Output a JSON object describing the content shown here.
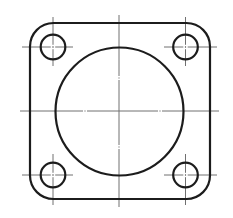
{
  "drawing": {
    "description": "Square flange plate with large central bore and four corner bolt holes (engineering top view)",
    "canvas": {
      "width": 233,
      "height": 218,
      "background": "#ffffff"
    },
    "colors": {
      "outline": "#1c1c1c",
      "centerline": "#707070"
    },
    "stroke_widths": {
      "outline": 2.2,
      "centerline": 1
    },
    "plate": {
      "x": 30,
      "y": 23,
      "width": 180,
      "height": 176,
      "corner_radius": 23.5
    },
    "bore": {
      "cx": 119.5,
      "cy": 111.5,
      "r": 64
    },
    "holes": [
      {
        "name": "hole-top-left",
        "cx": 53,
        "cy": 47,
        "r": 12.3
      },
      {
        "name": "hole-top-right",
        "cx": 185.5,
        "cy": 47,
        "r": 12.3
      },
      {
        "name": "hole-bottom-left",
        "cx": 53,
        "cy": 175,
        "r": 12.3
      },
      {
        "name": "hole-bottom-right",
        "cx": 185.5,
        "cy": 175,
        "r": 12.3
      }
    ],
    "main_centerlines": [
      {
        "name": "main-horizontal-centerline",
        "orientation": "h",
        "pos": 111,
        "from": 20,
        "to": 219,
        "breaks": [
          85,
          160
        ]
      },
      {
        "name": "main-vertical-centerline",
        "orientation": "v",
        "pos": 119,
        "from": 15,
        "to": 207,
        "breaks": [
          78,
          147
        ]
      }
    ],
    "hole_crosshairs": [
      {
        "hole": "hole-top-left",
        "h": {
          "from": 22,
          "to": 73
        },
        "v": {
          "from": 17,
          "to": 66
        }
      },
      {
        "hole": "hole-top-right",
        "h": {
          "from": 164,
          "to": 217
        },
        "v": {
          "from": 17,
          "to": 66
        }
      },
      {
        "hole": "hole-bottom-left",
        "h": {
          "from": 22,
          "to": 73
        },
        "v": {
          "from": 154,
          "to": 205
        }
      },
      {
        "hole": "hole-bottom-right",
        "h": {
          "from": 164,
          "to": 217
        },
        "v": {
          "from": 154,
          "to": 205
        }
      }
    ]
  }
}
